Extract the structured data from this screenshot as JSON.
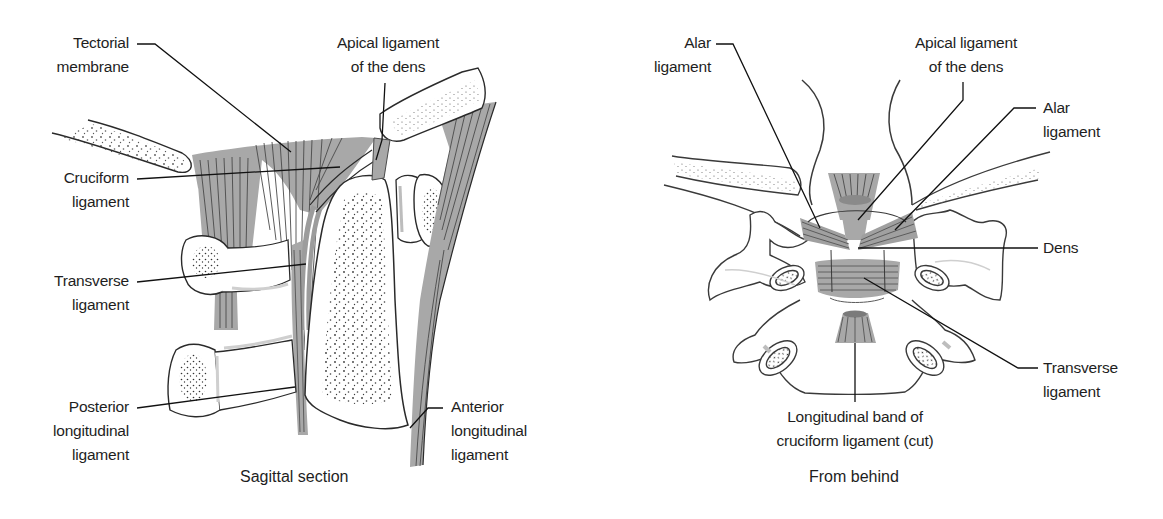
{
  "figure": {
    "colors": {
      "ligament_fill": "#a8a8a8",
      "ligament_dark": "#8c8c8c",
      "outline": "#2a2a2a",
      "bone_fill": "#ffffff",
      "bone_stipple": "#3a3a3a",
      "leader_line": "#111111",
      "shadow": "#cfcfcf"
    }
  },
  "left_panel": {
    "caption": "Sagittal section",
    "labels": {
      "tectorial_membrane": [
        "Tectorial",
        "membrane"
      ],
      "apical_ligament": [
        "Apical ligament",
        "of the dens"
      ],
      "cruciform_ligament": [
        "Cruciform",
        "ligament"
      ],
      "transverse_ligament": [
        "Transverse",
        "ligament"
      ],
      "posterior_longitudinal": [
        "Posterior",
        "longitudinal",
        "ligament"
      ],
      "anterior_longitudinal": [
        "Anterior",
        "longitudinal",
        "ligament"
      ]
    }
  },
  "right_panel": {
    "caption": "From behind",
    "labels": {
      "alar_left": [
        "Alar",
        "ligament"
      ],
      "apical_ligament": [
        "Apical ligament",
        "of the dens"
      ],
      "alar_right": [
        "Alar",
        "ligament"
      ],
      "dens": [
        "Dens"
      ],
      "transverse_ligament": [
        "Transverse",
        "ligament"
      ],
      "longitudinal_band": [
        "Longitudinal band of",
        "cruciform ligament (cut)"
      ]
    }
  }
}
